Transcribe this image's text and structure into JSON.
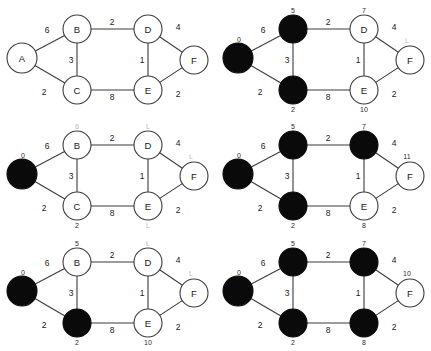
{
  "figure": {
    "colors": {
      "settled_node": "#0a0a0a",
      "unsettled_node": "#ffffff",
      "edge": "#3b3b3b",
      "text": "#1a1a1a",
      "faint_text": "#b8b8b8",
      "background": "#ffffff"
    },
    "graph": {
      "node_ids": [
        "A",
        "B",
        "C",
        "D",
        "E",
        "F"
      ],
      "edges": [
        {
          "from": "A",
          "to": "B",
          "weight": "6"
        },
        {
          "from": "A",
          "to": "C",
          "weight": "2"
        },
        {
          "from": "B",
          "to": "C",
          "weight": "3"
        },
        {
          "from": "B",
          "to": "D",
          "weight": "2"
        },
        {
          "from": "C",
          "to": "E",
          "weight": "8"
        },
        {
          "from": "D",
          "to": "E",
          "weight": "1"
        },
        {
          "from": "D",
          "to": "F",
          "weight": "4"
        },
        {
          "from": "E",
          "to": "F",
          "weight": "2"
        }
      ]
    },
    "panels": [
      {
        "id": "panel-1",
        "position": "top-left",
        "step": 1,
        "nodes": [
          {
            "id": "A",
            "label": "A",
            "settled": false,
            "show_label": true,
            "dist": "",
            "dist_faint": false
          },
          {
            "id": "B",
            "label": "B",
            "settled": false,
            "show_label": true,
            "dist": "",
            "dist_faint": false
          },
          {
            "id": "C",
            "label": "C",
            "settled": false,
            "show_label": true,
            "dist": "",
            "dist_faint": false
          },
          {
            "id": "D",
            "label": "D",
            "settled": false,
            "show_label": true,
            "dist": "",
            "dist_faint": false
          },
          {
            "id": "E",
            "label": "E",
            "settled": false,
            "show_label": true,
            "dist": "",
            "dist_faint": false
          },
          {
            "id": "F",
            "label": "F",
            "settled": false,
            "show_label": true,
            "dist": "",
            "dist_faint": false
          }
        ]
      },
      {
        "id": "panel-2",
        "position": "top-right",
        "step": 2,
        "nodes": [
          {
            "id": "A",
            "label": "",
            "settled": true,
            "show_label": false,
            "dist": "0",
            "dist_faint": false
          },
          {
            "id": "B",
            "label": "",
            "settled": true,
            "show_label": false,
            "dist": "5",
            "dist_faint": false
          },
          {
            "id": "C",
            "label": "",
            "settled": true,
            "show_label": false,
            "dist": "2",
            "dist_faint": false
          },
          {
            "id": "D",
            "label": "D",
            "settled": false,
            "show_label": true,
            "dist": "7",
            "dist_faint": false
          },
          {
            "id": "E",
            "label": "E",
            "settled": false,
            "show_label": true,
            "dist": "10",
            "dist_faint": false
          },
          {
            "id": "F",
            "label": "F",
            "settled": false,
            "show_label": true,
            "dist": "L",
            "dist_faint": true
          }
        ]
      },
      {
        "id": "panel-3",
        "position": "middle-left",
        "step": 3,
        "nodes": [
          {
            "id": "A",
            "label": "",
            "settled": true,
            "show_label": false,
            "dist": "0",
            "dist_faint": false
          },
          {
            "id": "B",
            "label": "B",
            "settled": false,
            "show_label": true,
            "dist": "6",
            "dist_faint": true
          },
          {
            "id": "C",
            "label": "C",
            "settled": false,
            "show_label": true,
            "dist": "2",
            "dist_faint": false
          },
          {
            "id": "D",
            "label": "D",
            "settled": false,
            "show_label": true,
            "dist": "L",
            "dist_faint": true
          },
          {
            "id": "E",
            "label": "E",
            "settled": false,
            "show_label": true,
            "dist": "L",
            "dist_faint": true
          },
          {
            "id": "F",
            "label": "F",
            "settled": false,
            "show_label": true,
            "dist": "L",
            "dist_faint": true
          }
        ]
      },
      {
        "id": "panel-4",
        "position": "middle-right",
        "step": 4,
        "nodes": [
          {
            "id": "A",
            "label": "",
            "settled": true,
            "show_label": false,
            "dist": "0",
            "dist_faint": false
          },
          {
            "id": "B",
            "label": "",
            "settled": true,
            "show_label": false,
            "dist": "5",
            "dist_faint": false
          },
          {
            "id": "C",
            "label": "",
            "settled": true,
            "show_label": false,
            "dist": "2",
            "dist_faint": false
          },
          {
            "id": "D",
            "label": "",
            "settled": true,
            "show_label": false,
            "dist": "7",
            "dist_faint": false
          },
          {
            "id": "E",
            "label": "E",
            "settled": false,
            "show_label": true,
            "dist": "8",
            "dist_faint": false
          },
          {
            "id": "F",
            "label": "F",
            "settled": false,
            "show_label": true,
            "dist": "11",
            "dist_faint": false
          }
        ]
      },
      {
        "id": "panel-5",
        "position": "bottom-left",
        "step": 5,
        "nodes": [
          {
            "id": "A",
            "label": "",
            "settled": true,
            "show_label": false,
            "dist": "0",
            "dist_faint": false
          },
          {
            "id": "B",
            "label": "B",
            "settled": false,
            "show_label": true,
            "dist": "5",
            "dist_faint": false
          },
          {
            "id": "C",
            "label": "",
            "settled": true,
            "show_label": false,
            "dist": "2",
            "dist_faint": false
          },
          {
            "id": "D",
            "label": "D",
            "settled": false,
            "show_label": true,
            "dist": "L",
            "dist_faint": true
          },
          {
            "id": "E",
            "label": "E",
            "settled": false,
            "show_label": true,
            "dist": "10",
            "dist_faint": false
          },
          {
            "id": "F",
            "label": "F",
            "settled": false,
            "show_label": true,
            "dist": "L",
            "dist_faint": true
          }
        ]
      },
      {
        "id": "panel-6",
        "position": "bottom-right",
        "step": 6,
        "nodes": [
          {
            "id": "A",
            "label": "",
            "settled": true,
            "show_label": false,
            "dist": "0",
            "dist_faint": false
          },
          {
            "id": "B",
            "label": "",
            "settled": true,
            "show_label": false,
            "dist": "5",
            "dist_faint": false
          },
          {
            "id": "C",
            "label": "",
            "settled": true,
            "show_label": false,
            "dist": "2",
            "dist_faint": false
          },
          {
            "id": "D",
            "label": "",
            "settled": true,
            "show_label": false,
            "dist": "7",
            "dist_faint": false
          },
          {
            "id": "E",
            "label": "",
            "settled": true,
            "show_label": false,
            "dist": "8",
            "dist_faint": false
          },
          {
            "id": "F",
            "label": "F",
            "settled": false,
            "show_label": true,
            "dist": "10",
            "dist_faint": false
          }
        ]
      }
    ]
  }
}
